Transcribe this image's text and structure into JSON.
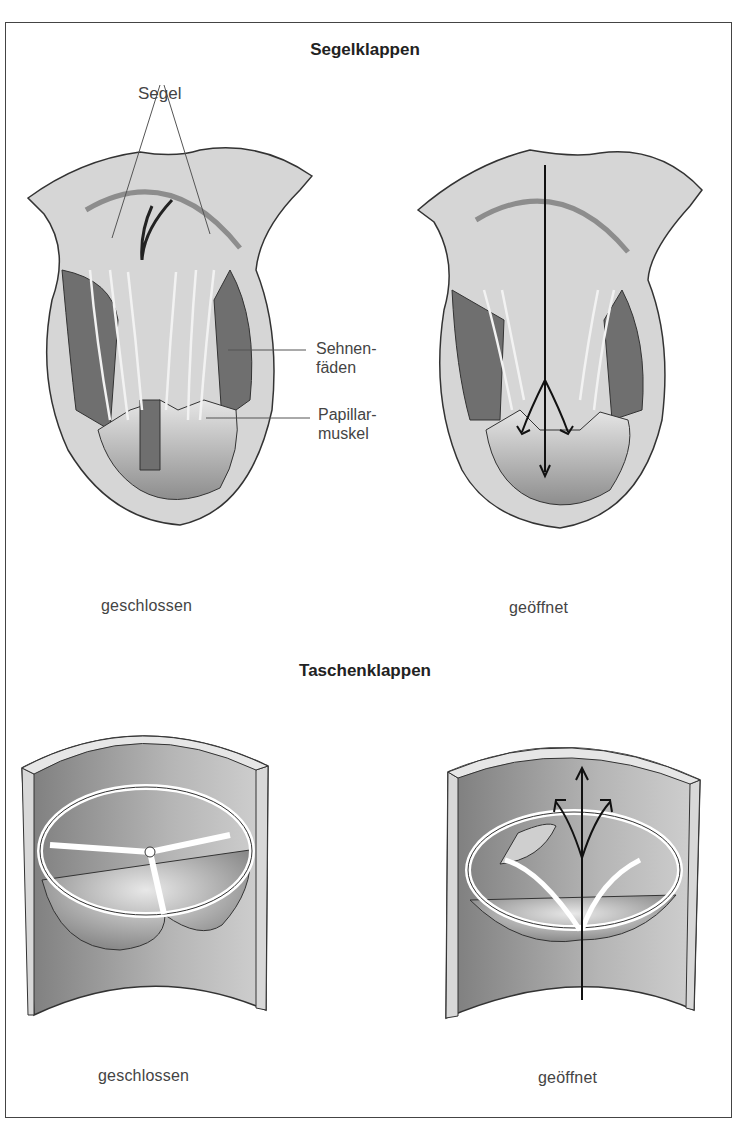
{
  "sections": {
    "top": {
      "title": "Segelklappen",
      "left_caption": "geschlossen",
      "right_caption": "geöffnet",
      "callouts": {
        "segel": "Segel",
        "sehnenfaeden_1": "Sehnen-",
        "sehnenfaeden_2": "fäden",
        "papillar_1": "Papillar-",
        "papillar_2": "muskel"
      }
    },
    "bottom": {
      "title": "Taschenklappen",
      "left_caption": "geschlossen",
      "right_caption": "geöffnet"
    }
  },
  "colors": {
    "wall_light": "#d4d4d4",
    "wall_mid": "#a9a9a9",
    "muscle_dark": "#6f6f6f",
    "outline": "#333333",
    "frame": "#444444"
  }
}
